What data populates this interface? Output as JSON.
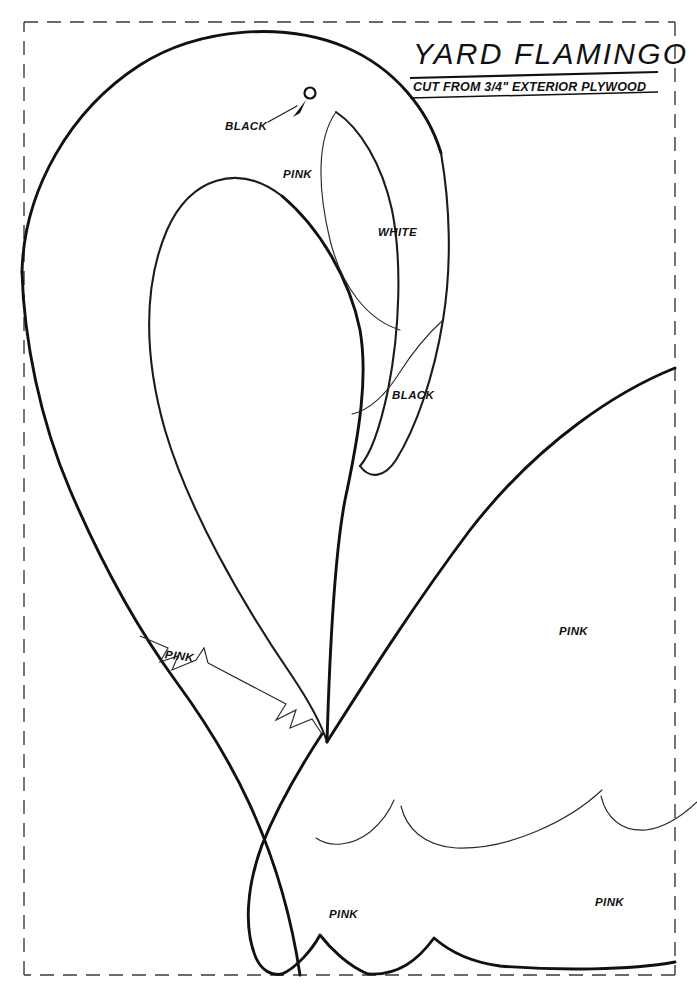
{
  "document": {
    "title": "YARD FLAMINGO",
    "subtitle": "CUT FROM 3/4\" EXTERIOR PLYWOOD"
  },
  "labels": [
    {
      "id": "black-eye",
      "text": "BLACK",
      "x": 225,
      "y": 120,
      "note": "leader line with arrow pointing to eye"
    },
    {
      "id": "pink-head",
      "text": "PINK",
      "x": 283,
      "y": 168
    },
    {
      "id": "white-beak",
      "text": "WHITE",
      "x": 378,
      "y": 226
    },
    {
      "id": "black-beak",
      "text": "BLACK",
      "x": 392,
      "y": 389
    },
    {
      "id": "pink-neck",
      "text": "PINK",
      "x": 165,
      "y": 650
    },
    {
      "id": "pink-body",
      "text": "PINK",
      "x": 559,
      "y": 625
    },
    {
      "id": "pink-tail",
      "text": "PINK",
      "x": 329,
      "y": 908
    },
    {
      "id": "pink-rear",
      "text": "PINK",
      "x": 595,
      "y": 896
    }
  ],
  "colors": {
    "ink": "#111111",
    "frame": "#3a3a3a",
    "paper": "#ffffff"
  },
  "parts": {
    "eye": {
      "cx": 310,
      "cy": 93,
      "r": 5
    },
    "frame": {
      "x": 24,
      "y": 22,
      "width": 651,
      "height": 953
    }
  }
}
